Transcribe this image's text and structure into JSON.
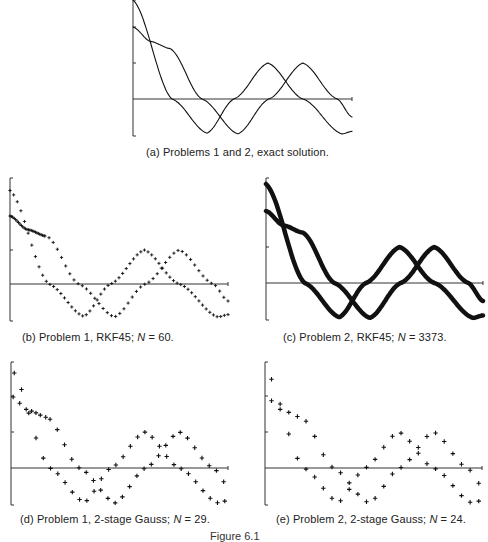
{
  "figure_label": "Figure 6.1",
  "chart_data": [
    {
      "id": "a",
      "type": "line",
      "title": "(a) Problems 1 and 2, exact solution.",
      "caption_prefix": "(a) Problems 1 and 2, exact solution.",
      "caption_n": "",
      "xlabel": "",
      "ylabel": "",
      "grid": false,
      "ylim": [
        -1.0,
        2.75
      ],
      "yticks": [
        1,
        2
      ],
      "stroke_width": 1,
      "style": "curve",
      "series": [
        {
          "name": "Problem 1",
          "keypoints": [
            [
              0,
              2.75
            ],
            [
              0.178,
              0
            ],
            [
              0.338,
              -0.95
            ],
            [
              0.461,
              0
            ],
            [
              0.616,
              1.0
            ],
            [
              0.776,
              0
            ],
            [
              0.954,
              -0.97
            ],
            [
              1.0,
              -0.9
            ]
          ]
        },
        {
          "name": "Problem 2",
          "keypoints": [
            [
              0,
              2.0
            ],
            [
              0.08,
              1.6
            ],
            [
              0.17,
              1.4
            ],
            [
              0.315,
              0
            ],
            [
              0.479,
              -0.97
            ],
            [
              0.621,
              0
            ],
            [
              0.776,
              1.0
            ],
            [
              0.932,
              0
            ],
            [
              1.0,
              -0.5
            ]
          ]
        }
      ]
    },
    {
      "id": "b",
      "type": "scatter",
      "title": "(b) Problem 1, RKF45; N = 60.",
      "caption_prefix": "(b)  Problem 1, RKF45; ",
      "caption_n": "N = 60.",
      "method": "RKF45",
      "N": 60,
      "style": "plus-dense",
      "series": [
        {
          "name": "Problem 1 (y1)",
          "points": 60
        },
        {
          "name": "Problem 1 (y2)",
          "points": 60
        }
      ]
    },
    {
      "id": "c",
      "type": "line",
      "title": "(c) Problem 2, RKF45; N = 3373.",
      "caption_prefix": "(c)  Problem 2, RKF45; ",
      "caption_n": "N = 3373.",
      "method": "RKF45",
      "N": 3373,
      "style": "thick-curve",
      "stroke_width": 4.5
    },
    {
      "id": "d",
      "type": "scatter",
      "title": "(d) Problem 1, 2-stage Gauss; N = 29.",
      "caption_prefix": "(d)  Problem 1, 2-stage Gauss; ",
      "caption_n": "N = 29.",
      "method": "2-stage Gauss",
      "N": 29,
      "style": "plus-sparse"
    },
    {
      "id": "e",
      "type": "scatter",
      "title": "(e) Problem 2, 2-stage Gauss; N = 24.",
      "caption_prefix": "(e)  Problem 2, 2-stage Gauss; ",
      "caption_n": "N = 24.",
      "method": "2-stage Gauss",
      "N": 24,
      "style": "plus-sparse"
    }
  ],
  "captions": {
    "a": "(a)  Problems 1 and 2, exact solution.",
    "b_prefix": "(b)  Problem 1, RKF45; ",
    "b_n": "N",
    "b_rest": " = 60.",
    "c_prefix": "(c)  Problem 2, RKF45; ",
    "c_n": "N",
    "c_rest": " = 3373.",
    "d_prefix": "(d)  Problem 1, 2-stage Gauss; ",
    "d_n": "N",
    "d_rest": " = 29.",
    "e_prefix": "(e)  Problem 2, 2-stage Gauss; ",
    "e_n": "N",
    "e_rest": " = 24."
  }
}
